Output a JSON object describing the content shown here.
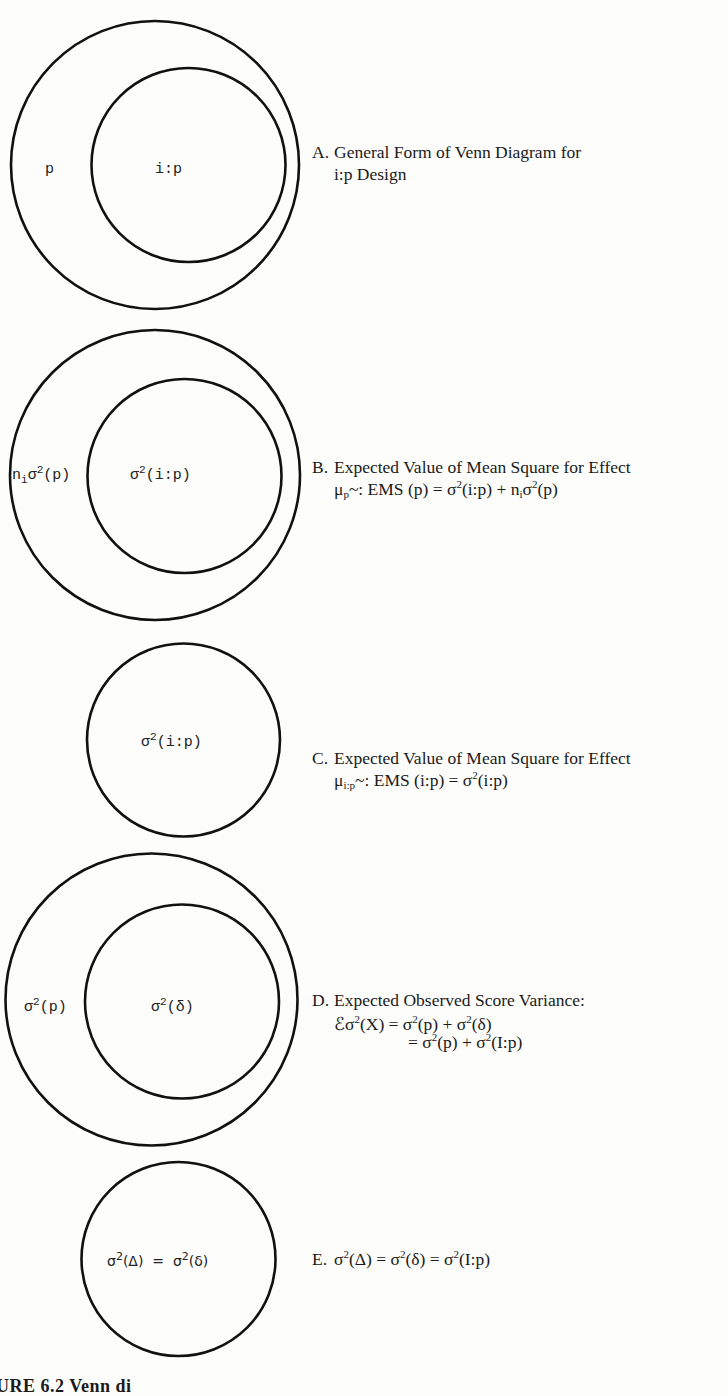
{
  "figure": {
    "caption_partial": "URE 6.2  Venn di",
    "panels": [
      {
        "id": "A",
        "letter": "A.",
        "caption_lines": [
          "General Form of Venn Diagram for",
          "i:p Design"
        ],
        "circle_labels": {
          "outer": "p",
          "inner": "i:p"
        }
      },
      {
        "id": "B",
        "letter": "B.",
        "caption_line1": "Expected Value of Mean Square for Effect",
        "formula": {
          "mu": "μ",
          "mu_sub": "p",
          "tilde": "~: EMS (p) = σ",
          "sup1": "2",
          "mid": "(i:p) + n",
          "n_sub": "i",
          "sigma": "σ",
          "sup2": "2",
          "end": "(p)"
        },
        "circle_labels": {
          "outer_n": "n",
          "outer_n_sub": "i",
          "outer_sigma": "σ",
          "outer_sup": "2",
          "outer_rest": "(p)",
          "inner_sigma": "σ",
          "inner_sup": "2",
          "inner_rest": "(i:p)"
        }
      },
      {
        "id": "C",
        "letter": "C.",
        "caption_line1": "Expected Value of Mean Square for Effect",
        "formula": {
          "mu": "μ",
          "mu_sub": "i:p",
          "rest": "~: EMS (i:p) = σ",
          "sup": "2",
          "end": "(i:p)"
        },
        "circle_labels": {
          "sigma": "σ",
          "sup": "2",
          "rest": "(i:p)"
        }
      },
      {
        "id": "D",
        "letter": "D.",
        "caption_line1": "Expected Observed Score Variance:",
        "formula_line1": {
          "e": "ℰσ",
          "sup0": "2",
          "a": "(X) = σ",
          "sup1": "2",
          "b": "(p) + σ",
          "sup2": "2",
          "c": "(δ)"
        },
        "formula_line2": {
          "a": "= σ",
          "sup1": "2",
          "b": "(p) + σ",
          "sup2": "2",
          "c": "(I:p)"
        },
        "circle_labels": {
          "outer_sigma": "σ",
          "outer_sup": "2",
          "outer_rest": "(p)",
          "inner_sigma": "σ",
          "inner_sup": "2",
          "inner_rest": "(δ)"
        }
      },
      {
        "id": "E",
        "letter": "E.",
        "formula": {
          "a": "σ",
          "sup1": "2",
          "b": "(Δ) = σ",
          "sup2": "2",
          "c": "(δ) = σ",
          "sup3": "2",
          "d": "(I:p)"
        },
        "circle_labels": {
          "a": "σ",
          "sup1": "2",
          "b": "(Δ)  =  σ",
          "sup2": "2",
          "c": "(δ)"
        }
      }
    ]
  },
  "colors": {
    "stroke": "#111111",
    "background": "#fdfdfc",
    "text": "#1a1a1a"
  }
}
